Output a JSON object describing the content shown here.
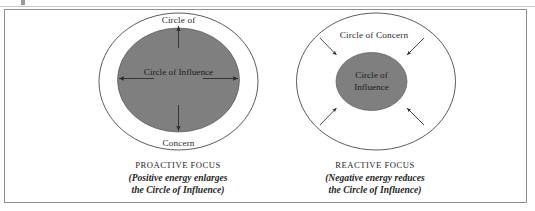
{
  "figure": {
    "title_alt": "Proactive Focus and Reactive Focus circles diagram",
    "colors": {
      "circle_fill": "#7f7f7f",
      "outline": "#4a4a4a",
      "frame": "#8e8e8e",
      "background": "#ffffff",
      "text": "#262626"
    }
  },
  "left_panel": {
    "outer_label_top": "Circle of",
    "outer_label_bottom": "Concern",
    "inner_label": "Circle of Influence",
    "caption_title": "PROACTIVE FOCUS",
    "caption_line1": "(Positive energy enlarges",
    "caption_line2": "the Circle of Influence)",
    "arrow_direction": "outward",
    "arrow_count": 4
  },
  "right_panel": {
    "outer_label": "Circle of Concern",
    "inner_label_line1": "Circle of",
    "inner_label_line2": "Influence",
    "caption_title": "REACTIVE FOCUS",
    "caption_line1": "(Negative energy reduces",
    "caption_line2": "the Circle of Influence)",
    "arrow_direction": "inward",
    "arrow_count": 4
  }
}
